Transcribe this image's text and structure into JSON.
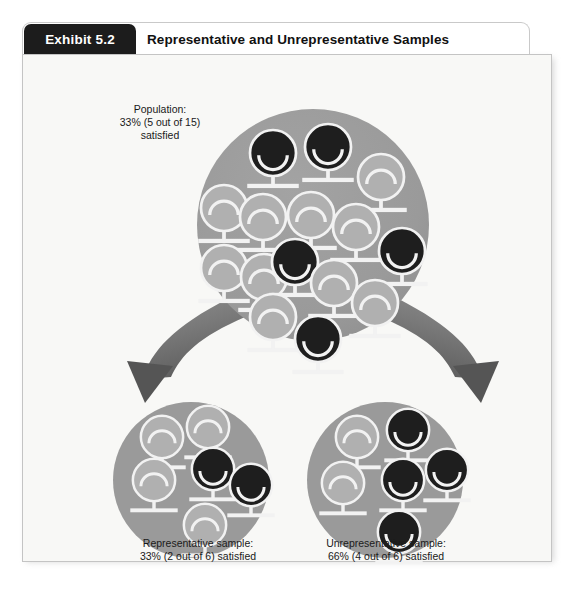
{
  "exhibit": {
    "tab_label": "Exhibit 5.2",
    "title": "Representative and Unrepresentative Samples"
  },
  "captions": {
    "population": "Population:\n33% (5 out of 15)\nsatisfied",
    "representative": "Representative sample:\n33% (2 out of 6) satisfied",
    "unrepresentative": "Unrepresentative sample:\n66% (4 out of 6) satisfied"
  },
  "colors": {
    "tab_bg": "#1c1c1c",
    "card_bg": "#f8f8f6",
    "circle_fill": "#9a9a9a",
    "figure_light": "#b0b0b0",
    "figure_dark": "#1e1e1e",
    "stroke_white": "#f2f2f2",
    "arrow_dark": "#6f6f6f",
    "arrow_light": "#d6d6d6"
  },
  "chart_data": {
    "type": "diagram",
    "title": "Representative and Unrepresentative Samples",
    "groups": [
      {
        "name": "population",
        "label": "Population: 33% (5 out of 15) satisfied",
        "total": 15,
        "satisfied": 5,
        "percent_satisfied": 33,
        "center": [
          290,
          170
        ],
        "radius": 116,
        "figures": [
          {
            "x": 250,
            "y": 98,
            "state": "satisfied"
          },
          {
            "x": 305,
            "y": 92,
            "state": "satisfied"
          },
          {
            "x": 358,
            "y": 122,
            "state": "unsatisfied"
          },
          {
            "x": 201,
            "y": 153,
            "state": "unsatisfied"
          },
          {
            "x": 240,
            "y": 162,
            "state": "unsatisfied"
          },
          {
            "x": 288,
            "y": 160,
            "state": "unsatisfied"
          },
          {
            "x": 333,
            "y": 172,
            "state": "unsatisfied"
          },
          {
            "x": 201,
            "y": 213,
            "state": "unsatisfied"
          },
          {
            "x": 241,
            "y": 222,
            "state": "unsatisfied"
          },
          {
            "x": 272,
            "y": 207,
            "state": "satisfied"
          },
          {
            "x": 311,
            "y": 228,
            "state": "unsatisfied"
          },
          {
            "x": 379,
            "y": 196,
            "state": "satisfied"
          },
          {
            "x": 352,
            "y": 248,
            "state": "unsatisfied"
          },
          {
            "x": 250,
            "y": 262,
            "state": "unsatisfied"
          },
          {
            "x": 295,
            "y": 284,
            "state": "satisfied"
          }
        ]
      },
      {
        "name": "representative_sample",
        "label": "Representative sample: 33% (2 out of 6) satisfied",
        "total": 6,
        "satisfied": 2,
        "percent_satisfied": 33,
        "center": [
          168,
          425
        ],
        "radius": 78,
        "figures": [
          {
            "x": 139,
            "y": 382,
            "state": "unsatisfied"
          },
          {
            "x": 185,
            "y": 372,
            "state": "unsatisfied"
          },
          {
            "x": 131,
            "y": 425,
            "state": "unsatisfied"
          },
          {
            "x": 190,
            "y": 414,
            "state": "satisfied"
          },
          {
            "x": 228,
            "y": 430,
            "state": "satisfied"
          },
          {
            "x": 182,
            "y": 470,
            "state": "unsatisfied"
          }
        ]
      },
      {
        "name": "unrepresentative_sample",
        "label": "Unrepresentative sample: 66% (4 out of 6) satisfied",
        "total": 6,
        "satisfied": 4,
        "percent_satisfied": 66,
        "center": [
          362,
          425
        ],
        "radius": 78,
        "figures": [
          {
            "x": 334,
            "y": 382,
            "state": "unsatisfied"
          },
          {
            "x": 385,
            "y": 375,
            "state": "satisfied"
          },
          {
            "x": 320,
            "y": 428,
            "state": "unsatisfied"
          },
          {
            "x": 380,
            "y": 425,
            "state": "satisfied"
          },
          {
            "x": 424,
            "y": 415,
            "state": "satisfied"
          },
          {
            "x": 376,
            "y": 477,
            "state": "satisfied"
          }
        ]
      }
    ],
    "arrows": [
      {
        "name": "arrow-to-representative",
        "from": "population",
        "to": "representative_sample",
        "direction": "down-left"
      },
      {
        "name": "arrow-to-unrepresentative",
        "from": "population",
        "to": "unrepresentative_sample",
        "direction": "down-right"
      }
    ]
  }
}
